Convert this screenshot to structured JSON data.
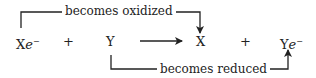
{
  "diagram": {
    "type": "redox-reaction",
    "species": [
      {
        "base": "X",
        "e": "e",
        "charge": "−"
      },
      {
        "op": "+"
      },
      {
        "base": "Y"
      },
      {
        "op": "→"
      },
      {
        "base": "X"
      },
      {
        "op": "+"
      },
      {
        "base": "Y",
        "e": "e",
        "charge": "−"
      }
    ],
    "labels": {
      "top": "becomes oxidized",
      "bottom": "becomes reduced"
    },
    "plus_sign": "+",
    "colors": {
      "line": "#222222",
      "text": "#222222",
      "background": "#ffffff"
    }
  }
}
